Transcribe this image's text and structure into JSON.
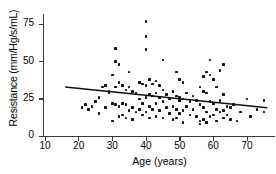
{
  "chart_data": {
    "type": "scatter",
    "title": "",
    "xlabel": "Age (years)",
    "ylabel": "Resistance (mm/Hg/s/mL)",
    "xlim": [
      10,
      78
    ],
    "ylim": [
      0,
      82
    ],
    "xticks": [
      10,
      20,
      30,
      40,
      50,
      60,
      70
    ],
    "yticks": [
      0,
      25,
      50,
      75
    ],
    "grid": false,
    "legend": null,
    "series": [
      {
        "name": "subjects",
        "marker": "filled-square",
        "color": "#111111",
        "points": [
          [
            21,
            19
          ],
          [
            22,
            21
          ],
          [
            23,
            18
          ],
          [
            24,
            20
          ],
          [
            25,
            23
          ],
          [
            26,
            26
          ],
          [
            26,
            15
          ],
          [
            27,
            33
          ],
          [
            28,
            34
          ],
          [
            28,
            19
          ],
          [
            29,
            29
          ],
          [
            29,
            30
          ],
          [
            30,
            41
          ],
          [
            30,
            22
          ],
          [
            30,
            10
          ],
          [
            31,
            59
          ],
          [
            31,
            50
          ],
          [
            31,
            33
          ],
          [
            31,
            21
          ],
          [
            32,
            48
          ],
          [
            32,
            36
          ],
          [
            32,
            20
          ],
          [
            32,
            13
          ],
          [
            33,
            34
          ],
          [
            33,
            22
          ],
          [
            33,
            14
          ],
          [
            34,
            31
          ],
          [
            34,
            21
          ],
          [
            34,
            12
          ],
          [
            35,
            43
          ],
          [
            35,
            33
          ],
          [
            35,
            17
          ],
          [
            36,
            30
          ],
          [
            36,
            19
          ],
          [
            36,
            11
          ],
          [
            37,
            29
          ],
          [
            37,
            16
          ],
          [
            38,
            36
          ],
          [
            38,
            25
          ],
          [
            38,
            18
          ],
          [
            39,
            35
          ],
          [
            39,
            22
          ],
          [
            39,
            14
          ],
          [
            40,
            77
          ],
          [
            40,
            67
          ],
          [
            40,
            58
          ],
          [
            40,
            34
          ],
          [
            40,
            26
          ],
          [
            40,
            16
          ],
          [
            41,
            38
          ],
          [
            41,
            28
          ],
          [
            41,
            20
          ],
          [
            41,
            12
          ],
          [
            42,
            35
          ],
          [
            42,
            27
          ],
          [
            42,
            18
          ],
          [
            43,
            37
          ],
          [
            43,
            29
          ],
          [
            43,
            22
          ],
          [
            43,
            13
          ],
          [
            44,
            34
          ],
          [
            44,
            26
          ],
          [
            44,
            17
          ],
          [
            45,
            51
          ],
          [
            45,
            31
          ],
          [
            45,
            23
          ],
          [
            45,
            12
          ],
          [
            46,
            28
          ],
          [
            46,
            19
          ],
          [
            47,
            25
          ],
          [
            47,
            15
          ],
          [
            48,
            30
          ],
          [
            48,
            20
          ],
          [
            48,
            11
          ],
          [
            49,
            43
          ],
          [
            49,
            27
          ],
          [
            49,
            18
          ],
          [
            49,
            12
          ],
          [
            50,
            38
          ],
          [
            50,
            26
          ],
          [
            50,
            24
          ],
          [
            50,
            15
          ],
          [
            51,
            36
          ],
          [
            51,
            25
          ],
          [
            51,
            17
          ],
          [
            51,
            9
          ],
          [
            52,
            29
          ],
          [
            52,
            20
          ],
          [
            53,
            23
          ],
          [
            53,
            14
          ],
          [
            54,
            27
          ],
          [
            54,
            18
          ],
          [
            55,
            24
          ],
          [
            55,
            13
          ],
          [
            56,
            33
          ],
          [
            56,
            21
          ],
          [
            56,
            10
          ],
          [
            56,
            8
          ],
          [
            57,
            40
          ],
          [
            57,
            30
          ],
          [
            57,
            19
          ],
          [
            57,
            11
          ],
          [
            58,
            43
          ],
          [
            58,
            29
          ],
          [
            58,
            16
          ],
          [
            58,
            9
          ],
          [
            59,
            51
          ],
          [
            59,
            41
          ],
          [
            59,
            23
          ],
          [
            59,
            13
          ],
          [
            60,
            38
          ],
          [
            60,
            22
          ],
          [
            60,
            14
          ],
          [
            61,
            33
          ],
          [
            61,
            18
          ],
          [
            61,
            10
          ],
          [
            62,
            44
          ],
          [
            62,
            24
          ],
          [
            62,
            16
          ],
          [
            63,
            48
          ],
          [
            63,
            28
          ],
          [
            63,
            17
          ],
          [
            63,
            12
          ],
          [
            64,
            20
          ],
          [
            64,
            14
          ],
          [
            65,
            19
          ],
          [
            65,
            11
          ],
          [
            66,
            21
          ],
          [
            67,
            10
          ],
          [
            68,
            16
          ],
          [
            70,
            25
          ],
          [
            71,
            13
          ],
          [
            73,
            18
          ],
          [
            75,
            24
          ],
          [
            75,
            16
          ]
        ]
      }
    ],
    "trendline": {
      "name": "least-squares fit",
      "color": "#111111",
      "x_start": 16,
      "y_start": 33,
      "x_end": 76,
      "y_end": 19
    }
  }
}
